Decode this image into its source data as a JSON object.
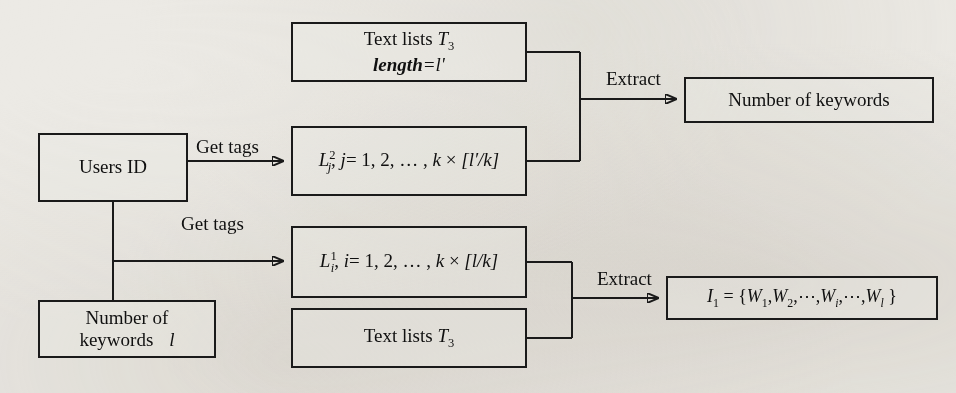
{
  "diagram": {
    "type": "flowchart",
    "title": "",
    "background_color": "#eceae5",
    "line_color": "#1a1a1a",
    "nodes": [
      {
        "id": "users-id",
        "label": "Users ID",
        "x": 38,
        "y": 133,
        "w": 150,
        "h": 69
      },
      {
        "id": "number-of-keywords-input",
        "label_line1": "Number of",
        "label_line2": "keywords",
        "label_symbol": "l",
        "x": 38,
        "y": 300,
        "w": 178,
        "h": 58
      },
      {
        "id": "text-lists-t3-top",
        "label_line1_prefix": "Text lists ",
        "label_line1_symbol": "T",
        "label_line1_sub": "3",
        "label_line2_word": "length",
        "label_line2_eq": "=",
        "label_line2_symbol": "l'",
        "x": 291,
        "y": 22,
        "w": 236,
        "h": 60
      },
      {
        "id": "l2-j-set",
        "label": "L²ⱼ, j = 1, 2, … , k × [l′/k]",
        "parts": {
          "L": "L",
          "sup": "2",
          "sub": "j",
          "index": "j",
          "seq": "= 1, 2, … , ",
          "k": "k",
          "times": "×",
          "bracket": "[l′/k]"
        },
        "x": 291,
        "y": 126,
        "w": 236,
        "h": 70
      },
      {
        "id": "l1-i-set",
        "label": "L¹ᵢ, i = 1, 2, … , k × [l/k]",
        "parts": {
          "L": "L",
          "sup": "1",
          "sub": "i",
          "index": "i",
          "seq": "= 1, 2, … , ",
          "k": "k",
          "times": "×",
          "bracket": "[l/k]"
        },
        "x": 291,
        "y": 226,
        "w": 236,
        "h": 72
      },
      {
        "id": "text-lists-t3-bottom",
        "label_prefix": "Text lists ",
        "label_symbol": "T",
        "label_sub": "3",
        "x": 291,
        "y": 308,
        "w": 236,
        "h": 60
      },
      {
        "id": "number-of-keywords-output",
        "label": "Number of keywords",
        "x": 684,
        "y": 77,
        "w": 250,
        "h": 46
      },
      {
        "id": "i1-word-set",
        "label": "I₁ = {W₁, W₂, ⋯, Wᵢ, ⋯, W_l }",
        "parts": {
          "I": "I",
          "Isub": "1",
          "eq": "=",
          "open": "{",
          "W": "W",
          "sub1": "1",
          "sub2": "2",
          "subi": "i",
          "subl": "l",
          "dots": "⋯",
          "comma": ",",
          "close": "}"
        },
        "x": 666,
        "y": 276,
        "w": 272,
        "h": 44
      }
    ],
    "edge_labels": [
      {
        "id": "get-tags-top",
        "text": "Get tags",
        "x": 196,
        "y": 136
      },
      {
        "id": "get-tags-bottom",
        "text": "Get tags",
        "x": 181,
        "y": 213
      },
      {
        "id": "extract-top",
        "text": "Extract",
        "x": 606,
        "y": 68
      },
      {
        "id": "extract-bottom",
        "text": "Extract",
        "x": 597,
        "y": 268
      }
    ],
    "edges": [
      {
        "from": "users-id",
        "to": "l2-j-set",
        "label": "Get tags",
        "arrow": true
      },
      {
        "from": "users-id",
        "to": "l1-i-set",
        "label": "Get tags",
        "arrow": true
      },
      {
        "from": "users-id",
        "to": "number-of-keywords-input",
        "label": "",
        "arrow": false
      },
      {
        "from": "text-lists-t3-top",
        "to": "number-of-keywords-output",
        "label": "Extract",
        "arrow": true
      },
      {
        "from": "l2-j-set",
        "to": "number-of-keywords-output",
        "label": "Extract",
        "arrow": true
      },
      {
        "from": "l1-i-set",
        "to": "i1-word-set",
        "label": "Extract",
        "arrow": true
      },
      {
        "from": "text-lists-t3-bottom",
        "to": "i1-word-set",
        "label": "Extract",
        "arrow": true
      }
    ]
  }
}
